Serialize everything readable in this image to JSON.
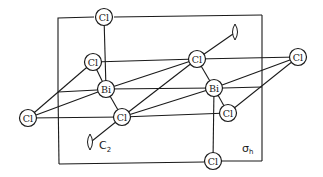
{
  "diagram": {
    "type": "molecular-structure-with-symmetry-elements",
    "plane_box": {
      "x1": 58,
      "y1": 16,
      "x2": 262,
      "y2": 162
    },
    "atoms": [
      {
        "id": "cl_top",
        "label": "Cl",
        "x": 104,
        "y": 17
      },
      {
        "id": "cl_upper_left",
        "label": "Cl",
        "x": 93,
        "y": 62
      },
      {
        "id": "bi_left",
        "label": "Bi",
        "x": 106,
        "y": 89
      },
      {
        "id": "cl_left",
        "label": "Cl",
        "x": 28,
        "y": 118
      },
      {
        "id": "cl_center",
        "label": "Cl",
        "x": 122,
        "y": 117
      },
      {
        "id": "cl_upper_mid",
        "label": "Cl",
        "x": 197,
        "y": 59
      },
      {
        "id": "bi_right",
        "label": "Bi",
        "x": 214,
        "y": 88
      },
      {
        "id": "cl_right",
        "label": "Cl",
        "x": 298,
        "y": 57
      },
      {
        "id": "cl_lower_mid",
        "label": "Cl",
        "x": 228,
        "y": 113
      },
      {
        "id": "cl_bottom",
        "label": "Cl",
        "x": 213,
        "y": 161
      }
    ],
    "bonds": [
      [
        "cl_top",
        "bi_left"
      ],
      [
        "cl_upper_left",
        "bi_left"
      ],
      [
        "cl_upper_left",
        "cl_upper_mid"
      ],
      [
        "cl_upper_left",
        "cl_left"
      ],
      [
        "bi_left",
        "cl_left"
      ],
      [
        "bi_left",
        "cl_center"
      ],
      [
        "bi_left",
        "cl_upper_mid"
      ],
      [
        "bi_left",
        "bi_right"
      ],
      [
        "cl_left",
        "cl_center"
      ],
      [
        "cl_center",
        "cl_upper_mid"
      ],
      [
        "cl_center",
        "bi_right"
      ],
      [
        "cl_center",
        "cl_lower_mid"
      ],
      [
        "cl_upper_mid",
        "bi_right"
      ],
      [
        "cl_upper_mid",
        "cl_right"
      ],
      [
        "bi_right",
        "cl_right"
      ],
      [
        "bi_right",
        "cl_lower_mid"
      ],
      [
        "bi_right",
        "cl_bottom"
      ],
      [
        "cl_lower_mid",
        "cl_right"
      ]
    ],
    "symmetry_elements": {
      "c2_axis": {
        "label": "C",
        "subscript": "2"
      },
      "sigma_h": {
        "label": "σ",
        "subscript": "h"
      }
    }
  }
}
